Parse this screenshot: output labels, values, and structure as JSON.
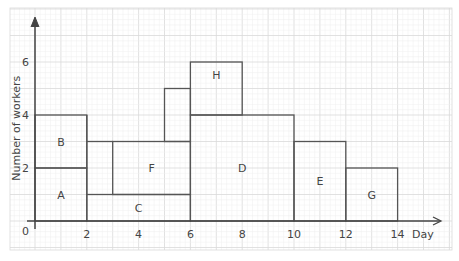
{
  "chart_data": {
    "type": "activity-resource-histogram",
    "xlabel": "Day",
    "ylabel": "Number of workers",
    "origin_label": "0",
    "x_ticks": [
      2,
      4,
      6,
      8,
      10,
      12,
      14
    ],
    "y_ticks": [
      2,
      4,
      6
    ],
    "xlim": [
      0,
      15.5
    ],
    "ylim": [
      0,
      7.5
    ],
    "grid": true,
    "colors": {
      "grid_major": "#d9d9d9",
      "grid_minor": "#eeeeee",
      "outline": "#555555",
      "text": "#444444"
    },
    "blocks": [
      {
        "label": "A",
        "x_start": 0,
        "x_end": 2,
        "y_bottom": 0,
        "y_top": 2
      },
      {
        "label": "B",
        "x_start": 0,
        "x_end": 2,
        "y_bottom": 2,
        "y_top": 4
      },
      {
        "label": "C",
        "x_start": 2,
        "x_end": 6,
        "y_bottom": 0,
        "y_top": 1
      },
      {
        "label": "F",
        "x_start": 3,
        "x_end": 6,
        "y_bottom": 1,
        "y_top": 3
      },
      {
        "label": "D",
        "x_start": 6,
        "x_end": 10,
        "y_bottom": 0,
        "y_top": 4
      },
      {
        "label": "H",
        "segments": [
          {
            "x_start": 5,
            "x_end": 6,
            "y_bottom": 3,
            "y_top": 5
          },
          {
            "x_start": 6,
            "x_end": 8,
            "y_bottom": 4,
            "y_top": 6
          }
        ]
      },
      {
        "label": "E",
        "x_start": 10,
        "x_end": 12,
        "y_bottom": 0,
        "y_top": 3
      },
      {
        "label": "G",
        "x_start": 12,
        "x_end": 14,
        "y_bottom": 0,
        "y_top": 2
      }
    ]
  }
}
